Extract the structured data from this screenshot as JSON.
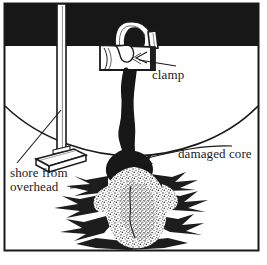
{
  "figure": {
    "frame": {
      "border_color": "#1a1a1a",
      "background_color": "#ffffff",
      "x": 4,
      "y": 3,
      "width": 255,
      "height": 248
    },
    "ceiling_band": {
      "name": "overhead slab",
      "color": "#171717",
      "x": 4,
      "y": 3,
      "width": 255,
      "height": 43
    },
    "horizon": {
      "name": "curved wall-floor junction",
      "color": "#1a1a1a"
    }
  },
  "labels": {
    "clamp": "clamp",
    "damaged_core": "damaged core",
    "shore_line1": "shore from",
    "shore_line2": "overhead"
  },
  "caption": {
    "text": ""
  },
  "elements": {
    "clamp": {
      "name": "clamp",
      "description": "C-hook clamp gripping the overhead slab with rectangular bearing block"
    },
    "shore": {
      "name": "shore from overhead",
      "description": "vertical post with angled flat base plate"
    },
    "core": {
      "name": "damaged core",
      "description": "dark irregular column of damaged material descending from the clamp"
    },
    "debris": {
      "name": "debris pile",
      "description": "stippled rubble spreading across the floor"
    }
  },
  "colors": {
    "ink": "#1a1a1a",
    "solid_black": "#171717",
    "paper": "#ffffff",
    "stipple": "#3a3a3a",
    "caption_gray": "#6e6e6e"
  }
}
